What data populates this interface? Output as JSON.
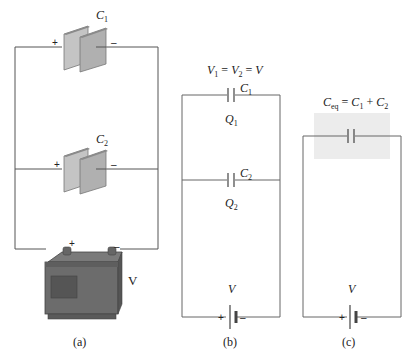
{
  "panel_a": {
    "caption": "(a)",
    "capacitor_1": {
      "symbol": "C",
      "subscript": "1",
      "plus": "+",
      "minus": "–"
    },
    "capacitor_2": {
      "symbol": "C",
      "subscript": "2",
      "plus": "+",
      "minus": "–"
    },
    "battery": {
      "label": "V",
      "plus": "+",
      "minus": "–"
    }
  },
  "panel_b": {
    "caption": "(b)",
    "equation": {
      "v1": "V",
      "v1_sub": "1",
      "eq1": " = ",
      "v2": "V",
      "v2_sub": "2",
      "eq2": " = ",
      "v": "V"
    },
    "capacitor_1": {
      "symbol": "C",
      "subscript": "1"
    },
    "charge_1": {
      "symbol": "Q",
      "subscript": "1"
    },
    "capacitor_2": {
      "symbol": "C",
      "subscript": "2"
    },
    "charge_2": {
      "symbol": "Q",
      "subscript": "2"
    },
    "battery": {
      "label": "V",
      "plus": "+",
      "minus": "–"
    }
  },
  "panel_c": {
    "caption": "(c)",
    "equation": {
      "ceq": "C",
      "ceq_sub": "eq",
      "eq": " = ",
      "c1": "C",
      "c1_sub": "1",
      "plus": " + ",
      "c2": "C",
      "c2_sub": "2"
    },
    "battery": {
      "label": "V",
      "plus": "+",
      "minus": "–"
    }
  },
  "colors": {
    "wire": "#555555",
    "plate_front": "#b8b8b8",
    "plate_edge": "#7a7a7a",
    "battery_body": "#6e6e6e",
    "battery_dark": "#555555",
    "highlight_box": "#ececec"
  }
}
